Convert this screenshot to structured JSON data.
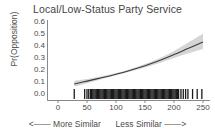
{
  "chart_data": {
    "type": "line",
    "title": "Local/Low-Status Party Service",
    "xlabel": "",
    "ylabel": "Pr(Opposition)",
    "xlim": [
      -10,
      262
    ],
    "ylim": [
      0.0,
      0.63
    ],
    "grid": false,
    "legend": null,
    "xticks": [
      0,
      50,
      100,
      150,
      200,
      250
    ],
    "xtick_labels": [
      "0",
      "50",
      "100",
      "150",
      "200",
      "250"
    ],
    "yticks": [
      0.0,
      0.1,
      0.2,
      0.3,
      0.4,
      0.5,
      0.6
    ],
    "ytick_labels": [
      "0.0",
      "0.1",
      "0.2",
      "0.3",
      "0.4",
      "0.5",
      "0.6"
    ],
    "x_axis_annotation_left": "<—— More Similar",
    "x_axis_annotation_right": "Less Similar ——>",
    "series": [
      {
        "name": "Predicted probability",
        "type": "line",
        "color": "#3c3c3c",
        "x": [
          28,
          50,
          75,
          100,
          125,
          150,
          175,
          200,
          225,
          250
        ],
        "values": [
          0.1,
          0.124,
          0.152,
          0.182,
          0.215,
          0.252,
          0.295,
          0.345,
          0.398,
          0.45
        ]
      },
      {
        "name": "95% confidence band upper",
        "type": "band-upper",
        "color": "#bfbfbf",
        "x": [
          28,
          50,
          75,
          100,
          125,
          150,
          175,
          200,
          225,
          250
        ],
        "values": [
          0.126,
          0.142,
          0.164,
          0.192,
          0.226,
          0.266,
          0.315,
          0.375,
          0.445,
          0.52
        ]
      },
      {
        "name": "95% confidence band lower",
        "type": "band-lower",
        "color": "#bfbfbf",
        "x": [
          28,
          50,
          75,
          100,
          125,
          150,
          175,
          200,
          225,
          250
        ],
        "values": [
          0.078,
          0.106,
          0.14,
          0.172,
          0.204,
          0.238,
          0.275,
          0.316,
          0.356,
          0.392
        ]
      },
      {
        "name": "rug (observations)",
        "type": "rug",
        "color": "#1a1a1a",
        "x": [
          28,
          46,
          50,
          53,
          56,
          58,
          60,
          62,
          64,
          66,
          68,
          70,
          72,
          74,
          76,
          78,
          80,
          82,
          84,
          86,
          88,
          90,
          92,
          94,
          96,
          98,
          100,
          102,
          104,
          106,
          108,
          110,
          112,
          114,
          116,
          118,
          120,
          122,
          124,
          126,
          128,
          130,
          132,
          134,
          136,
          138,
          140,
          142,
          144,
          146,
          148,
          150,
          152,
          154,
          156,
          158,
          160,
          162,
          164,
          166,
          168,
          170,
          172,
          174,
          176,
          178,
          180,
          182,
          184,
          186,
          188,
          190,
          192,
          194,
          196,
          198,
          200,
          202,
          204,
          206,
          208,
          212,
          216,
          220,
          224,
          232,
          240,
          248
        ]
      }
    ]
  },
  "axis_style": {
    "axis_color": "#6b6b6b",
    "line_color": "#3c3c3c",
    "band_color": "#c4c4c4",
    "rug_color": "#1a1a1a",
    "background": "#ffffff"
  }
}
